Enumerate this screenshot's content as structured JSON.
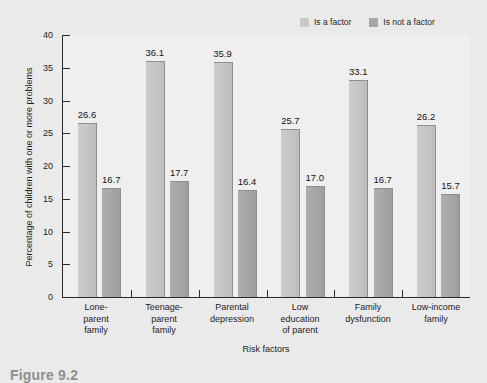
{
  "chart_data": {
    "type": "bar",
    "title": "",
    "subtitle": "",
    "xlabel": "Risk factors",
    "ylabel": "Percentage of children with one or more problems",
    "ylim": [
      0,
      40
    ],
    "yticks": [
      0,
      5,
      10,
      15,
      20,
      25,
      30,
      35,
      40
    ],
    "grid": false,
    "legend_position": "top-right",
    "categories": [
      "Lone-\nparent\nfamily",
      "Teenage-\nparent\nfamily",
      "Parental\ndepression",
      "Low\neducation\nof parent",
      "Family\ndysfunction",
      "Low-income\nfamily"
    ],
    "category_lines": [
      [
        "Lone-",
        "parent",
        "family"
      ],
      [
        "Teenage-",
        "parent",
        "family"
      ],
      [
        "Parental",
        "depression"
      ],
      [
        "Low",
        "education",
        "of parent"
      ],
      [
        "Family",
        "dysfunction"
      ],
      [
        "Low-income",
        "family"
      ]
    ],
    "series": [
      {
        "name": "Is a factor",
        "color": "#c4c4c4",
        "values": [
          26.6,
          36.1,
          35.9,
          25.7,
          33.1,
          26.2
        ]
      },
      {
        "name": "Is not a factor",
        "color": "#a5a5a5",
        "values": [
          16.7,
          17.7,
          16.4,
          17.0,
          16.7,
          15.7
        ]
      }
    ]
  },
  "legend": {
    "items": [
      {
        "label": "Is a factor",
        "color": "#c9c9c9"
      },
      {
        "label": "Is not a factor",
        "color": "#a7a7a7"
      }
    ]
  },
  "caption": {
    "text": "Figure 9.2"
  },
  "colors": {
    "background": "#ebeaea",
    "plot_background": "#efefef",
    "axis": "#2a2a2a",
    "series_1": "#c4c4c4",
    "series_2": "#a5a5a5"
  }
}
